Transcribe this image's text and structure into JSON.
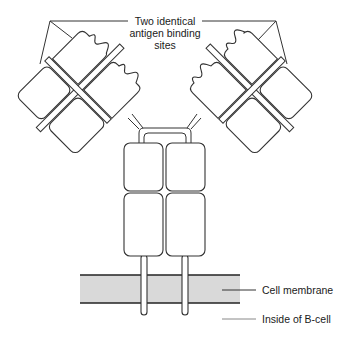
{
  "diagram": {
    "labels": {
      "binding_sites_line1": "Two identical",
      "binding_sites_line2": "antigen binding",
      "binding_sites_line3": "sites",
      "membrane": "Cell membrane",
      "inside": "Inside of B-cell"
    },
    "colors": {
      "stroke": "#333333",
      "membrane_fill": "#d9d9d9",
      "background": "#ffffff"
    }
  }
}
